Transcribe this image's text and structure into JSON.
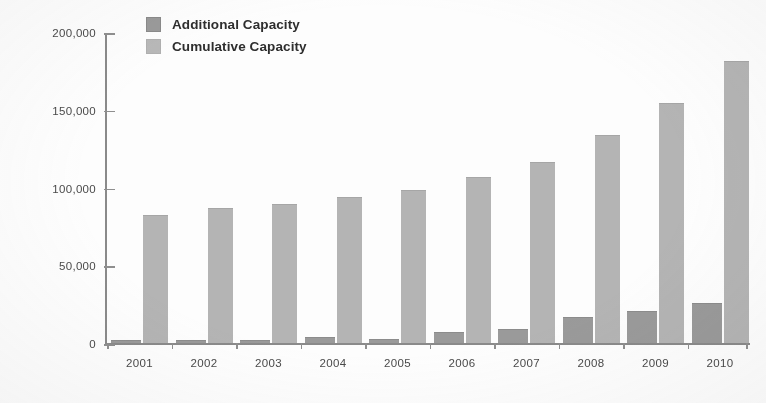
{
  "chart_data": {
    "type": "bar",
    "title": "",
    "subtitle": "",
    "xlabel": "",
    "ylabel": "",
    "categories": [
      "2001",
      "2002",
      "2003",
      "2004",
      "2005",
      "2006",
      "2007",
      "2008",
      "2009",
      "2010"
    ],
    "series": [
      {
        "name": "Additional Capacity",
        "color": "#9a9a9a",
        "values": [
          1000,
          1500,
          1500,
          3000,
          2000,
          6500,
          8500,
          16000,
          20000,
          25000
        ]
      },
      {
        "name": "Cumulative Capacity",
        "color": "#b4b4b4",
        "values": [
          82000,
          86000,
          88500,
          93500,
          97500,
          106000,
          115500,
          133000,
          153500,
          181000
        ]
      }
    ],
    "ylim": [
      0,
      200000
    ],
    "ytick_labels": [
      "0",
      "50,000",
      "100,000",
      "150,000",
      "200,000"
    ],
    "ytick_values": [
      0,
      50000,
      100000,
      150000,
      200000
    ],
    "grid": false,
    "legend_position": "top-left"
  },
  "legend": {
    "items": [
      {
        "label": "Additional Capacity",
        "swatch": "additional-swatch"
      },
      {
        "label": "Cumulative Capacity",
        "swatch": "cumulative-swatch"
      }
    ]
  },
  "colors": {
    "additional": "#9a9a9a",
    "cumulative": "#b4b4b4",
    "axis": "#8a8a8a",
    "text": "#4a4a4a",
    "legend_text": "#2e2e2e",
    "background": "#fdfdfd"
  }
}
